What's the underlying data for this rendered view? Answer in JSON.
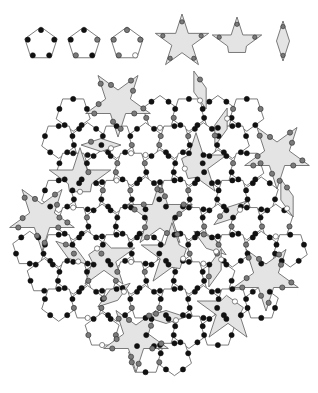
{
  "figure": {
    "caption_cut": "",
    "colors": {
      "background": "#ffffff",
      "outline": "#5a5a5a",
      "grey_fill": "#e4e4e4",
      "dot_black": "#111111",
      "dot_grey": "#7a7a7a",
      "dot_open": "#ffffff"
    },
    "prototiles": [
      {
        "name": "pentagon-type-1",
        "shape": "pentagon",
        "cx": 41,
        "cy": 44,
        "r": 17,
        "rot": 0,
        "fill": "white",
        "marks": [
          "black",
          "black",
          "black",
          "black",
          "black"
        ]
      },
      {
        "name": "pentagon-type-2",
        "shape": "pentagon",
        "cx": 84,
        "cy": 44,
        "r": 17,
        "rot": 0,
        "fill": "white",
        "marks": [
          "black",
          "grey",
          "black",
          "grey",
          "black"
        ]
      },
      {
        "name": "pentagon-type-3",
        "shape": "pentagon",
        "cx": 127,
        "cy": 44,
        "r": 17,
        "rot": 0,
        "fill": "white",
        "marks": [
          "grey",
          "grey",
          "open",
          "grey",
          "grey"
        ]
      },
      {
        "name": "star",
        "shape": "star",
        "cx": 182,
        "cy": 42,
        "r": 28,
        "rot": 0,
        "fill": "grey"
      },
      {
        "name": "boat",
        "shape": "boat",
        "cx": 237,
        "cy": 43,
        "r": 26,
        "rot": 0,
        "fill": "grey"
      },
      {
        "name": "diamond",
        "shape": "diamond",
        "cx": 283,
        "cy": 41,
        "r": 20,
        "rot": 0,
        "fill": "grey"
      }
    ],
    "tiling": {
      "edge": 21,
      "origin": [
        160,
        215
      ],
      "stars": [
        [
          160,
          215,
          0
        ],
        [
          118,
          103,
          36
        ],
        [
          277,
          155,
          36
        ],
        [
          42,
          217,
          36
        ],
        [
          266,
          277,
          36
        ],
        [
          136,
          338,
          36
        ]
      ],
      "diamonds": [
        [
          101,
          145,
          90
        ],
        [
          221,
          127,
          18
        ],
        [
          230,
          213,
          54
        ],
        [
          287,
          198,
          162
        ],
        [
          72,
          253,
          126
        ],
        [
          114,
          295,
          54
        ],
        [
          210,
          243,
          126
        ],
        [
          166,
          317,
          90
        ],
        [
          200,
          90,
          162
        ],
        [
          215,
          268,
          18
        ]
      ],
      "boats": [
        [
          80,
          180,
          0
        ],
        [
          196,
          165,
          72
        ],
        [
          104,
          258,
          144
        ],
        [
          228,
          311,
          216
        ],
        [
          172,
          255,
          288
        ]
      ]
    }
  }
}
